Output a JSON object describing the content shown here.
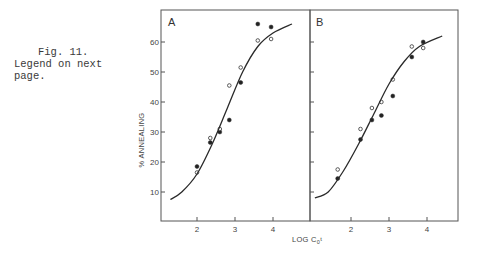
{
  "caption": {
    "line1": "Fig. 11.",
    "line2": "Legend on next",
    "line3": "page."
  },
  "chart_data": [
    {
      "type": "scatter",
      "panel": "A",
      "title": "A",
      "xlabel": "LOG C0t",
      "ylabel": "% ANNEALING",
      "xlim": [
        1.0,
        5.0
      ],
      "ylim": [
        0,
        70
      ],
      "xticks": [
        2,
        3,
        4
      ],
      "yticks": [
        10,
        20,
        30,
        40,
        50,
        60
      ],
      "grid": false,
      "legend": "none",
      "series": [
        {
          "name": "filled circles",
          "marker": "filled",
          "x": [
            2.0,
            2.35,
            2.6,
            2.85,
            3.15,
            3.6,
            3.95
          ],
          "y": [
            18.5,
            26.5,
            30,
            34,
            46.5,
            66,
            65
          ]
        },
        {
          "name": "open circles",
          "marker": "open",
          "x": [
            2.0,
            2.35,
            2.6,
            2.85,
            3.15,
            3.6,
            3.95
          ],
          "y": [
            16.5,
            28,
            31,
            45.5,
            51.5,
            60.5,
            61
          ]
        },
        {
          "name": "fitted curve",
          "marker": "line",
          "x": [
            1.3,
            1.6,
            2.0,
            2.4,
            2.8,
            3.2,
            3.6,
            4.0,
            4.5
          ],
          "y": [
            7.5,
            10,
            16,
            26,
            38,
            50,
            58.5,
            63,
            66
          ]
        }
      ]
    },
    {
      "type": "scatter",
      "panel": "B",
      "title": "B",
      "xlabel": "LOG C0t",
      "ylabel": "% ANNEALING",
      "xlim": [
        1.0,
        5.0
      ],
      "ylim": [
        0,
        70
      ],
      "xticks": [
        2,
        3,
        4
      ],
      "yticks": [
        10,
        20,
        30,
        40,
        50,
        60
      ],
      "grid": false,
      "legend": "none",
      "series": [
        {
          "name": "filled circles",
          "marker": "filled",
          "x": [
            1.65,
            2.25,
            2.55,
            2.8,
            3.1,
            3.6,
            3.9
          ],
          "y": [
            14.5,
            27.5,
            34,
            35.5,
            42,
            55,
            60
          ]
        },
        {
          "name": "open circles",
          "marker": "open",
          "x": [
            1.65,
            2.25,
            2.55,
            2.8,
            3.1,
            3.6,
            3.9
          ],
          "y": [
            17.5,
            31,
            38,
            40,
            47.5,
            58.5,
            58
          ]
        },
        {
          "name": "fitted curve",
          "marker": "line",
          "x": [
            1.05,
            1.4,
            1.8,
            2.2,
            2.6,
            3.0,
            3.4,
            3.8,
            4.4
          ],
          "y": [
            8,
            10,
            17,
            26,
            36,
            46,
            53.5,
            58.5,
            62
          ]
        }
      ]
    }
  ],
  "axis_labels": {
    "y": "% ANNEALING",
    "x_main": "LOG C",
    "x_sub": "0",
    "x_tail": "t"
  },
  "panels": {
    "a_label": "A",
    "b_label": "B"
  },
  "tick_labels": {
    "y": [
      "60",
      "50",
      "40",
      "30",
      "20",
      "10"
    ],
    "x": [
      "2",
      "3",
      "4"
    ]
  }
}
